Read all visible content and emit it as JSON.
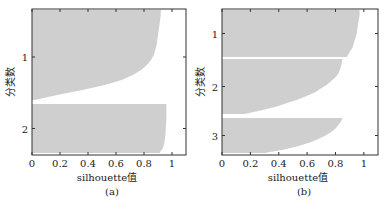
{
  "chart_data": [
    {
      "type": "bar",
      "subtype": "silhouette",
      "caption": "(a)",
      "xlabel": "silhouette值",
      "ylabel": "分类数",
      "xlim": [
        0,
        1.1
      ],
      "xticks": [
        "0",
        "0.2",
        "0.4",
        "0.6",
        "0.8",
        "1"
      ],
      "yticks": [
        "1",
        "2"
      ],
      "grid": false,
      "fill_color": "#cfcfcf",
      "clusters": [
        {
          "name": "1",
          "max_value": 0.92,
          "min_value": 0.0,
          "profile": [
            0.92,
            0.92,
            0.915,
            0.91,
            0.905,
            0.9,
            0.895,
            0.89,
            0.88,
            0.87,
            0.85,
            0.82,
            0.78,
            0.72,
            0.64,
            0.52,
            0.36,
            0.18,
            0.02
          ]
        },
        {
          "name": "2",
          "max_value": 0.96,
          "min_value": 0.0,
          "profile": [
            0.96,
            0.96,
            0.96,
            0.96,
            0.958,
            0.956,
            0.954,
            0.95,
            0.945,
            0.935,
            0.91
          ]
        }
      ]
    },
    {
      "type": "bar",
      "subtype": "silhouette",
      "caption": "(b)",
      "xlabel": "silhouette值",
      "ylabel": "分类数",
      "xlim": [
        0,
        1.1
      ],
      "xticks": [
        "0",
        "0.2",
        "0.4",
        "0.6",
        "0.8",
        "1"
      ],
      "yticks": [
        "1",
        "2",
        "3"
      ],
      "grid": false,
      "fill_color": "#cfcfcf",
      "clusters": [
        {
          "name": "1",
          "max_value": 0.97,
          "min_value": 0.0,
          "profile": [
            0.97,
            0.97,
            0.965,
            0.96,
            0.955,
            0.95,
            0.94,
            0.93,
            0.92,
            0.9,
            0.88
          ]
        },
        {
          "name": "2",
          "max_value": 0.85,
          "min_value": 0.0,
          "profile": [
            0.85,
            0.845,
            0.84,
            0.83,
            0.82,
            0.8,
            0.77,
            0.74,
            0.7,
            0.66,
            0.6,
            0.54,
            0.46,
            0.38,
            0.28,
            0.16
          ]
        },
        {
          "name": "3",
          "max_value": 0.85,
          "min_value": 0.0,
          "profile": [
            0.85,
            0.84,
            0.82,
            0.8,
            0.77,
            0.73,
            0.68,
            0.62,
            0.54,
            0.44,
            0.3
          ]
        }
      ]
    }
  ],
  "panels": {
    "a": {
      "caption": "(a)",
      "xlabel": "silhouette值",
      "ylabel": "分类数"
    },
    "b": {
      "caption": "(b)",
      "xlabel": "silhouette值",
      "ylabel": "分类数"
    }
  }
}
